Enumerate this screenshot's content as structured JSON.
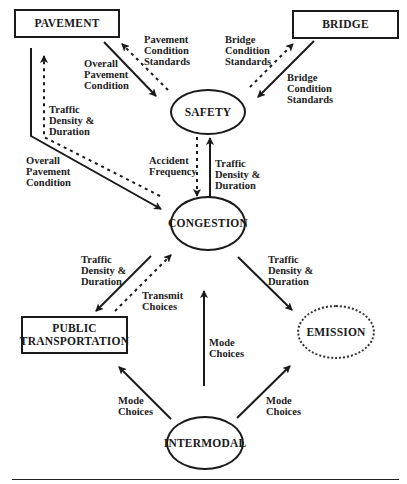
{
  "nodes": {
    "pavement": "PAVEMENT",
    "bridge": "BRIDGE",
    "safety": "SAFETY",
    "congestion": "CONGESTION",
    "public_transportation": "PUBLIC\nTRANSPORTATION",
    "emission": "EMISSION",
    "intermodal": "INTERMODAL"
  },
  "edges": [
    {
      "from": "pavement",
      "to": "safety",
      "style": "solid",
      "label": "Overall\nPavement\nCondition"
    },
    {
      "from": "safety",
      "to": "pavement",
      "style": "dotted",
      "label": "Pavement\nCondition\nStandards"
    },
    {
      "from": "bridge",
      "to": "safety",
      "style": "solid",
      "label": "Bridge\nCondition\nStandards"
    },
    {
      "from": "safety",
      "to": "bridge",
      "style": "dotted",
      "label": "Bridge\nCondition\nStandards"
    },
    {
      "from": "pavement",
      "to": "congestion",
      "style": "solid",
      "label": "Overall\nPavement\nCondition"
    },
    {
      "from": "congestion",
      "to": "pavement",
      "style": "dotted",
      "label": "Traffic\nDensity &\nDuration"
    },
    {
      "from": "safety",
      "to": "congestion",
      "style": "dotted",
      "label": "Accident\nFrequency"
    },
    {
      "from": "congestion",
      "to": "safety",
      "style": "solid",
      "label": "Traffic\nDensity &\nDuration"
    },
    {
      "from": "congestion",
      "to": "public_transportation",
      "style": "solid",
      "label": "Traffic\nDensity &\nDuration"
    },
    {
      "from": "public_transportation",
      "to": "congestion",
      "style": "dotted",
      "label": "Transmit\nChoices"
    },
    {
      "from": "congestion",
      "to": "emission",
      "style": "solid",
      "label": "Traffic\nDensity &\nDuration"
    },
    {
      "from": "intermodal",
      "to": "congestion",
      "style": "solid",
      "label": "Mode\nChoices"
    },
    {
      "from": "intermodal",
      "to": "public_transportation",
      "style": "solid",
      "label": "Mode\nChoices"
    },
    {
      "from": "intermodal",
      "to": "emission",
      "style": "solid",
      "label": "Mode\nChoices"
    }
  ],
  "labels": {
    "pav_to_safety": "Overall\nPavement\nCondition",
    "safety_to_pav": "Pavement\nCondition\nStandards",
    "safety_to_bridge": "Bridge\nCondition\nStandards",
    "bridge_to_safety": "Bridge\nCondition\nStandards",
    "cong_to_pav": "Traffic\nDensity &\nDuration",
    "pav_to_cong": "Overall\nPavement\nCondition",
    "accident": "Accident\nFrequency",
    "cong_to_safety": "Traffic\nDensity &\nDuration",
    "cong_to_pt": "Traffic\nDensity &\nDuration",
    "transmit": "Transmit\nChoices",
    "cong_to_emission": "Traffic\nDensity &\nDuration",
    "mode_center": "Mode\nChoices",
    "mode_left": "Mode\nChoices",
    "mode_right": "Mode\nChoices"
  },
  "colors": {
    "ink": "#1a1a1a",
    "background": "#ffffff"
  }
}
